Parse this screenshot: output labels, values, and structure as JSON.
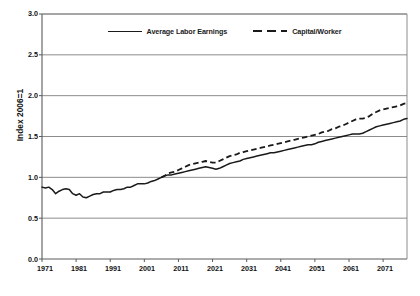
{
  "chart": {
    "ylabel": "Index 2006=1",
    "xlabel": "",
    "title": "",
    "yticks": [
      "0.0",
      "0.5",
      "1.0",
      "1.5",
      "2.0",
      "2.5",
      "3.0"
    ],
    "xticks": [
      "1971",
      "1981",
      "1991",
      "2001",
      "2011",
      "2021",
      "2031",
      "2041",
      "2051",
      "2061",
      "2071"
    ],
    "legend": [
      {
        "label": "Average Labor Earnings",
        "style": "solid"
      },
      {
        "label": "Capital/Worker",
        "style": "dashed"
      }
    ],
    "colors": {
      "line": "#1a1a1a",
      "grid": "#808080",
      "axis": "#595959",
      "background": "#ffffff"
    }
  },
  "chart_data": {
    "type": "line",
    "title": "",
    "xlabel": "",
    "ylabel": "Index 2006=1",
    "xlim": [
      1971,
      2078
    ],
    "ylim": [
      0.0,
      3.0
    ],
    "grid": true,
    "legend_position": "top-center",
    "x": [
      1971,
      1972,
      1973,
      1974,
      1975,
      1976,
      1977,
      1978,
      1979,
      1980,
      1981,
      1982,
      1983,
      1984,
      1985,
      1986,
      1987,
      1988,
      1989,
      1990,
      1991,
      1992,
      1993,
      1994,
      1995,
      1996,
      1997,
      1998,
      1999,
      2000,
      2001,
      2002,
      2003,
      2004,
      2005,
      2006,
      2007,
      2008,
      2009,
      2010,
      2011,
      2012,
      2013,
      2014,
      2015,
      2016,
      2017,
      2018,
      2019,
      2020,
      2021,
      2022,
      2023,
      2024,
      2025,
      2026,
      2027,
      2028,
      2029,
      2030,
      2031,
      2032,
      2033,
      2034,
      2035,
      2036,
      2037,
      2038,
      2039,
      2040,
      2041,
      2042,
      2043,
      2044,
      2045,
      2046,
      2047,
      2048,
      2049,
      2050,
      2051,
      2052,
      2053,
      2054,
      2055,
      2056,
      2057,
      2058,
      2059,
      2060,
      2061,
      2062,
      2063,
      2064,
      2065,
      2066,
      2067,
      2068,
      2069,
      2070,
      2071,
      2072,
      2073,
      2074,
      2075,
      2076,
      2077,
      2078
    ],
    "series": [
      {
        "name": "Average Labor Earnings",
        "style": "solid",
        "values": [
          0.88,
          0.87,
          0.88,
          0.85,
          0.8,
          0.83,
          0.85,
          0.86,
          0.85,
          0.8,
          0.78,
          0.8,
          0.76,
          0.75,
          0.77,
          0.79,
          0.8,
          0.8,
          0.82,
          0.82,
          0.82,
          0.84,
          0.85,
          0.85,
          0.86,
          0.88,
          0.88,
          0.9,
          0.92,
          0.92,
          0.92,
          0.93,
          0.95,
          0.96,
          0.98,
          1.0,
          1.02,
          1.03,
          1.03,
          1.04,
          1.05,
          1.06,
          1.07,
          1.08,
          1.09,
          1.1,
          1.11,
          1.12,
          1.13,
          1.12,
          1.11,
          1.1,
          1.11,
          1.13,
          1.15,
          1.17,
          1.18,
          1.19,
          1.2,
          1.22,
          1.23,
          1.24,
          1.25,
          1.26,
          1.27,
          1.28,
          1.29,
          1.3,
          1.3,
          1.31,
          1.32,
          1.33,
          1.34,
          1.35,
          1.36,
          1.37,
          1.38,
          1.39,
          1.4,
          1.4,
          1.41,
          1.43,
          1.44,
          1.45,
          1.46,
          1.47,
          1.48,
          1.49,
          1.5,
          1.51,
          1.52,
          1.53,
          1.53,
          1.53,
          1.54,
          1.56,
          1.58,
          1.6,
          1.62,
          1.63,
          1.64,
          1.65,
          1.66,
          1.67,
          1.68,
          1.69,
          1.71,
          1.72
        ]
      },
      {
        "name": "Capital/Worker",
        "style": "dashed",
        "values": [
          null,
          null,
          null,
          null,
          null,
          null,
          null,
          null,
          null,
          null,
          null,
          null,
          null,
          null,
          null,
          null,
          null,
          null,
          null,
          null,
          null,
          null,
          null,
          null,
          null,
          null,
          null,
          null,
          null,
          null,
          null,
          null,
          null,
          null,
          null,
          1.0,
          1.02,
          1.05,
          1.06,
          1.07,
          1.09,
          1.11,
          1.13,
          1.15,
          1.16,
          1.17,
          1.18,
          1.19,
          1.2,
          1.19,
          1.18,
          1.18,
          1.2,
          1.22,
          1.24,
          1.26,
          1.27,
          1.28,
          1.3,
          1.31,
          1.32,
          1.33,
          1.34,
          1.35,
          1.36,
          1.37,
          1.38,
          1.39,
          1.4,
          1.41,
          1.42,
          1.43,
          1.44,
          1.45,
          1.46,
          1.47,
          1.48,
          1.49,
          1.5,
          1.51,
          1.52,
          1.53,
          1.55,
          1.56,
          1.57,
          1.59,
          1.6,
          1.62,
          1.63,
          1.65,
          1.67,
          1.69,
          1.71,
          1.72,
          1.72,
          1.73,
          1.75,
          1.78,
          1.8,
          1.82,
          1.83,
          1.84,
          1.85,
          1.86,
          1.87,
          1.88,
          1.9,
          1.91
        ]
      }
    ]
  }
}
